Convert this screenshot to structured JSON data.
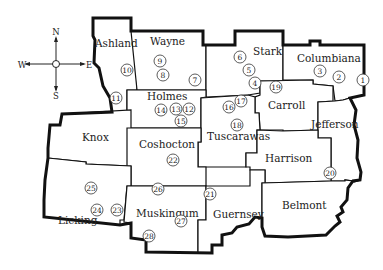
{
  "compass": {
    "north": "N",
    "south": "S",
    "east": "E",
    "west": "W"
  },
  "counties": [
    {
      "name": "Ashland",
      "x": 95,
      "y": 47
    },
    {
      "name": "Wayne",
      "x": 162,
      "y": 45
    },
    {
      "name": "Stark",
      "x": 261,
      "y": 51
    },
    {
      "name": "Columbiana",
      "x": 323,
      "y": 58
    },
    {
      "name": "Holmes",
      "x": 167,
      "y": 97
    },
    {
      "name": "Carroll",
      "x": 287,
      "y": 106
    },
    {
      "name": "Knox",
      "x": 84,
      "y": 139
    },
    {
      "name": "Tuscarawas",
      "x": 237,
      "y": 137
    },
    {
      "name": "Jefferson",
      "x": 345,
      "y": 125
    },
    {
      "name": "Coshocton",
      "x": 158,
      "y": 144
    },
    {
      "name": "Harrison",
      "x": 295,
      "y": 158
    },
    {
      "name": "Licking",
      "x": 74,
      "y": 220
    },
    {
      "name": "Muskingum",
      "x": 153,
      "y": 214
    },
    {
      "name": "Guernsey",
      "x": 232,
      "y": 216
    },
    {
      "name": "Belmont",
      "x": 299,
      "y": 205
    }
  ],
  "markers": [
    {
      "n": "1",
      "x": 354,
      "y": 81
    },
    {
      "n": "2",
      "x": 339,
      "y": 77
    },
    {
      "n": "3",
      "x": 320,
      "y": 71
    },
    {
      "n": "4",
      "x": 254,
      "y": 83
    },
    {
      "n": "5",
      "x": 245,
      "y": 70
    },
    {
      "name_note": "",
      "n": "6",
      "x": 238,
      "y": 57
    },
    {
      "n": "7",
      "x": 194,
      "y": 80
    },
    {
      "n": "8",
      "x": 164,
      "y": 75
    },
    {
      "n": "9",
      "x": 160,
      "y": 61
    },
    {
      "n": "10",
      "x": 127,
      "y": 70
    },
    {
      "n": "11",
      "x": 116,
      "y": 98
    },
    {
      "n": "12",
      "x": 190,
      "y": 109
    },
    {
      "n": "13",
      "x": 176,
      "y": 109
    },
    {
      "n": "14",
      "x": 161,
      "y": 110
    },
    {
      "n": "15",
      "x": 182,
      "y": 121
    },
    {
      "n": "16",
      "x": 228,
      "y": 107
    },
    {
      "n": "17",
      "x": 241,
      "y": 101
    },
    {
      "n": "18",
      "x": 236,
      "y": 126
    },
    {
      "n": "19",
      "x": 276,
      "y": 87
    },
    {
      "n": "20",
      "x": 358,
      "y": 173
    },
    {
      "n": "21",
      "x": 210,
      "y": 194
    },
    {
      "n": "22",
      "x": 173,
      "y": 160
    },
    {
      "n": "23",
      "x": 117,
      "y": 210
    },
    {
      "n": "24",
      "x": 97,
      "y": 210
    },
    {
      "n": "25",
      "x": 91,
      "y": 188
    },
    {
      "n": "26",
      "x": 158,
      "y": 189
    },
    {
      "n": "27",
      "x": 181,
      "y": 221
    },
    {
      "n": "28",
      "x": 149,
      "y": 236
    }
  ]
}
